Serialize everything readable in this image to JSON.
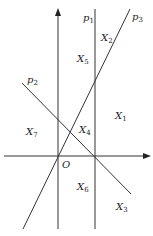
{
  "diagram": {
    "origin_label": "O",
    "lines": [
      {
        "id": "p1",
        "label": "p",
        "sub": "1"
      },
      {
        "id": "p2",
        "label": "p",
        "sub": "2"
      },
      {
        "id": "p3",
        "label": "p",
        "sub": "3"
      }
    ],
    "regions": [
      {
        "id": "X1",
        "label": "X",
        "sub": "1"
      },
      {
        "id": "X2",
        "label": "X",
        "sub": "2"
      },
      {
        "id": "X3",
        "label": "X",
        "sub": "3"
      },
      {
        "id": "X4",
        "label": "X",
        "sub": "4"
      },
      {
        "id": "X5",
        "label": "X",
        "sub": "5"
      },
      {
        "id": "X6",
        "label": "X",
        "sub": "6"
      },
      {
        "id": "X7",
        "label": "X",
        "sub": "7"
      }
    ],
    "colors": {
      "stroke": "#333333",
      "background": "#ffffff"
    }
  }
}
